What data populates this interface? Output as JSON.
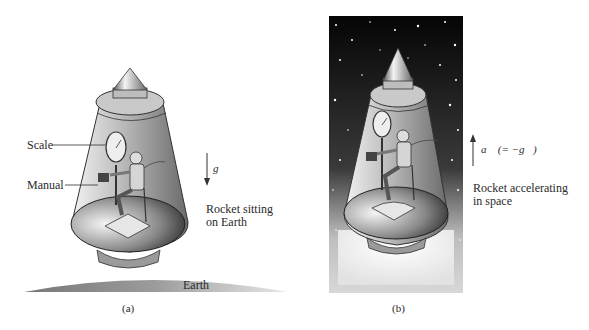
{
  "figure": {
    "panel_a": {
      "caption": "(a)",
      "labels": {
        "scale": "Scale",
        "manual": "Manual",
        "description_line1": "Rocket sitting",
        "description_line2": "on Earth",
        "ground": "Earth",
        "vector": "g⃗"
      },
      "arrow_direction": "down"
    },
    "panel_b": {
      "caption": "(b)",
      "labels": {
        "description_line1": "Rocket accelerating",
        "description_line2": "in space",
        "vector": "a⃗ (= −g⃗)"
      },
      "arrow_direction": "up",
      "background": "starfield"
    }
  },
  "colors": {
    "space_dark": "#0a0a0a",
    "hull_light": "#d8d8d8",
    "hull_dark": "#6a6a6a",
    "earth": "#9a9a9a",
    "text": "#2a2a2a"
  }
}
